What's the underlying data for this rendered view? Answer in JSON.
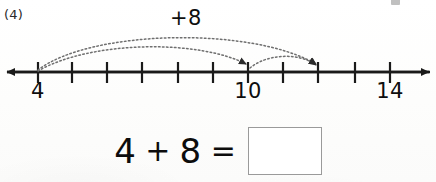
{
  "worksheet": {
    "problem_number": "(4)",
    "background_color": "#fdfdfc",
    "ink_color": "#111111"
  },
  "number_line": {
    "jump_label": "+8",
    "axis_color": "#1a1a1a",
    "arc_color": "#6f6f6f",
    "left_arrow": true,
    "right_arrow": true,
    "labeled_ticks": [
      {
        "value": "4",
        "x": 38
      },
      {
        "value": "10",
        "x": 248
      },
      {
        "value": "14",
        "x": 390
      }
    ],
    "tick_positions": [
      38,
      72,
      107,
      142,
      178,
      213,
      248,
      283,
      318,
      355,
      390
    ],
    "jump_arcs": [
      {
        "name": "outer-arc",
        "from_x": 38,
        "to_x": 318,
        "apex_y": 40
      },
      {
        "name": "inner-arc",
        "from_x": 38,
        "to_x": 248,
        "apex_y": 48
      },
      {
        "name": "small-arc",
        "from_x": 248,
        "to_x": 318,
        "apex_y": 59
      }
    ]
  },
  "equation": {
    "left_operand": "4",
    "operator": "+",
    "right_operand": "8",
    "equals": "=",
    "answer": "",
    "answer_placeholder": ""
  }
}
